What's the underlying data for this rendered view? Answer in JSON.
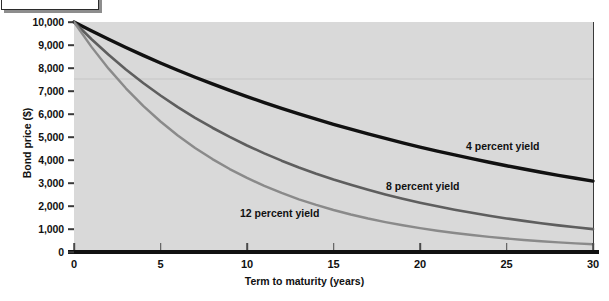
{
  "chart_data": {
    "type": "line",
    "title": "",
    "xlabel": "Term to maturity (years)",
    "ylabel": "Bond price ($)",
    "xlim": [
      0,
      30
    ],
    "ylim": [
      0,
      10000
    ],
    "xticks": [
      0,
      5,
      10,
      15,
      20,
      25,
      30
    ],
    "xtick_labels": [
      "0",
      "5",
      "10",
      "15",
      "20",
      "25",
      "30"
    ],
    "yticks": [
      0,
      1000,
      2000,
      3000,
      4000,
      5000,
      6000,
      7000,
      8000,
      9000,
      10000
    ],
    "ytick_labels": [
      "0",
      "1,000",
      "2,000",
      "3,000",
      "4,000",
      "5,000",
      "6,000",
      "7,000",
      "8,000",
      "9,000",
      "10,000"
    ],
    "grid": false,
    "legend_position": "inline-annotations",
    "x": [
      0,
      1,
      2,
      3,
      4,
      5,
      6,
      7,
      8,
      9,
      10,
      11,
      12,
      13,
      14,
      15,
      16,
      17,
      18,
      19,
      20,
      21,
      22,
      23,
      24,
      25,
      26,
      27,
      28,
      29,
      30
    ],
    "series": [
      {
        "name": "4 percent yield",
        "color": "#111111",
        "annotation": "4 percent yield",
        "values": [
          10000,
          9615,
          9246,
          8890,
          8548,
          8219,
          7903,
          7599,
          7307,
          7026,
          6756,
          6496,
          6246,
          6006,
          5775,
          5553,
          5339,
          5134,
          4936,
          4746,
          4564,
          4388,
          4220,
          4057,
          3901,
          3751,
          3607,
          3468,
          3335,
          3207,
          3083
        ]
      },
      {
        "name": "8 percent yield",
        "color": "#5e5e5e",
        "annotation": "8 percent yield",
        "values": [
          10000,
          9259,
          8573,
          7938,
          7350,
          6806,
          6302,
          5835,
          5403,
          5002,
          4632,
          4289,
          3971,
          3677,
          3405,
          3152,
          2919,
          2703,
          2502,
          2317,
          2145,
          1987,
          1839,
          1703,
          1577,
          1460,
          1352,
          1252,
          1159,
          1073,
          994
        ]
      },
      {
        "name": "12 percent yield",
        "color": "#8a8a8a",
        "annotation": "12 percent yield",
        "values": [
          10000,
          8929,
          7972,
          7118,
          6355,
          5674,
          5066,
          4523,
          4039,
          3606,
          3220,
          2875,
          2567,
          2292,
          2046,
          1827,
          1631,
          1456,
          1300,
          1161,
          1037,
          926,
          826,
          738,
          659,
          588,
          525,
          469,
          419,
          374,
          334
        ]
      }
    ]
  },
  "axes": {
    "x_title": "Term to maturity (years)",
    "y_title": "Bond price ($)"
  }
}
